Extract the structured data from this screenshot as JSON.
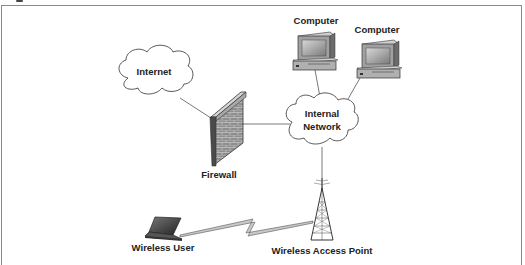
{
  "diagram": {
    "title": "",
    "nodes": [
      {
        "id": "internet",
        "label": "Internet",
        "icon": "cloud-icon"
      },
      {
        "id": "firewall",
        "label": "Firewall",
        "icon": "brick-wall-icon"
      },
      {
        "id": "internal-network",
        "label_line1": "Internal",
        "label_line2": "Network",
        "icon": "cloud-icon"
      },
      {
        "id": "computer-1",
        "label": "Computer",
        "icon": "desktop-computer-icon"
      },
      {
        "id": "computer-2",
        "label": "Computer",
        "icon": "desktop-computer-icon"
      },
      {
        "id": "wireless-access-point",
        "label": "Wireless Access Point",
        "icon": "radio-tower-icon"
      },
      {
        "id": "wireless-user",
        "label": "Wireless User",
        "icon": "laptop-icon"
      }
    ],
    "edges": [
      {
        "from": "internet",
        "to": "firewall",
        "type": "wired"
      },
      {
        "from": "firewall",
        "to": "internal-network",
        "type": "wired"
      },
      {
        "from": "internal-network",
        "to": "computer-1",
        "type": "wired"
      },
      {
        "from": "internal-network",
        "to": "computer-2",
        "type": "wired"
      },
      {
        "from": "internal-network",
        "to": "wireless-access-point",
        "type": "wired"
      },
      {
        "from": "wireless-user",
        "to": "wireless-access-point",
        "type": "wireless-lightning"
      }
    ],
    "colors": {
      "line": "#555555",
      "frame": "#8a8a8a",
      "brick": "#8c8c8c",
      "screen": "#9a9a9a",
      "case": "#bdbdbd"
    }
  }
}
